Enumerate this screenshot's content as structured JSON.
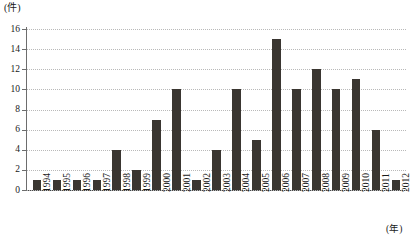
{
  "chart_data": {
    "type": "bar",
    "title": "",
    "xlabel": "(年)",
    "ylabel": "(件)",
    "ylim": [
      0,
      16
    ],
    "ytick_step": 2,
    "yticks": [
      "0",
      "2",
      "4",
      "6",
      "8",
      "10",
      "12",
      "14",
      "16"
    ],
    "grid": true,
    "legend": false,
    "bar_color": "#3a3631",
    "categories": [
      "1994",
      "1995",
      "1996",
      "1997",
      "1998",
      "1999",
      "2000",
      "2001",
      "2002",
      "2003",
      "2004",
      "2005",
      "2006",
      "2007",
      "2008",
      "2009",
      "2010",
      "2011",
      "2012"
    ],
    "values": [
      1,
      1,
      1,
      1,
      4,
      2,
      7,
      10,
      1,
      4,
      10,
      5,
      15,
      10,
      12,
      10,
      11,
      6,
      1
    ]
  },
  "axes": {
    "y_unit_label": "(件)",
    "x_unit_label": "(年)"
  }
}
